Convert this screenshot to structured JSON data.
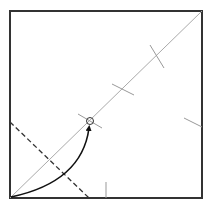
{
  "diagram": {
    "type": "origami-fold-diagram",
    "paper": {
      "x": 10,
      "y": 11,
      "width": 192,
      "height": 187,
      "stroke": "#333333"
    },
    "diagonal": {
      "x1": 10,
      "y1": 198,
      "x2": 202,
      "y2": 11,
      "stroke": "#aaaaaa"
    },
    "tick_marks": [
      {
        "x1": 78,
        "y1": 114,
        "x2": 102,
        "y2": 128
      },
      {
        "x1": 112,
        "y1": 84,
        "x2": 134,
        "y2": 95
      },
      {
        "x1": 150,
        "y1": 45,
        "x2": 164,
        "y2": 68
      },
      {
        "x1": 184,
        "y1": 118,
        "x2": 202,
        "y2": 127
      },
      {
        "x1": 106,
        "y1": 182,
        "x2": 106,
        "y2": 198
      }
    ],
    "valley_fold": {
      "x1": 10,
      "y1": 122,
      "x2": 89,
      "y2": 198,
      "stroke": "#333333",
      "dash": "5,3"
    },
    "target_point": {
      "cx": 90,
      "cy": 121,
      "r": 3.5
    },
    "arrow": {
      "path": "M 11 197 Q 82 182 89 128",
      "stroke": "#111111"
    }
  }
}
